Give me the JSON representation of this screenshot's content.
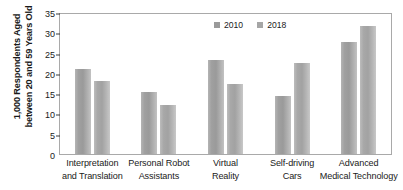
{
  "chart_data": {
    "type": "bar",
    "title": "",
    "subtitle": "",
    "xlabel": "",
    "ylabel_line1": "1,000 Respondents Aged",
    "ylabel_line2": "between 20 and 59 Years Old",
    "categories": [
      {
        "line1": "Interpretation",
        "line2": "and Translation"
      },
      {
        "line1": "Personal Robot",
        "line2": "Assistants"
      },
      {
        "line1": "Virtual",
        "line2": "Reality"
      },
      {
        "line1": "Self-driving",
        "line2": "Cars"
      },
      {
        "line1": "Advanced",
        "line2": "Medical Technology"
      }
    ],
    "series": [
      {
        "name": "2010",
        "color": "#9a9a9a",
        "values": [
          21.0,
          15.2,
          23.2,
          14.4,
          27.5
        ]
      },
      {
        "name": "2018",
        "color": "#a6a6a6",
        "values": [
          18.1,
          12.2,
          17.3,
          22.4,
          31.5
        ]
      }
    ],
    "ylim": [
      0,
      35
    ],
    "yticks": [
      0,
      5,
      10,
      15,
      20,
      25,
      30,
      35
    ],
    "ytick_labels": [
      "0",
      "5",
      "10",
      "15",
      "20",
      "25",
      "30",
      "35"
    ],
    "grid": false,
    "legend_position": "top-center",
    "legend_entries": [
      "2010",
      "2018"
    ]
  }
}
